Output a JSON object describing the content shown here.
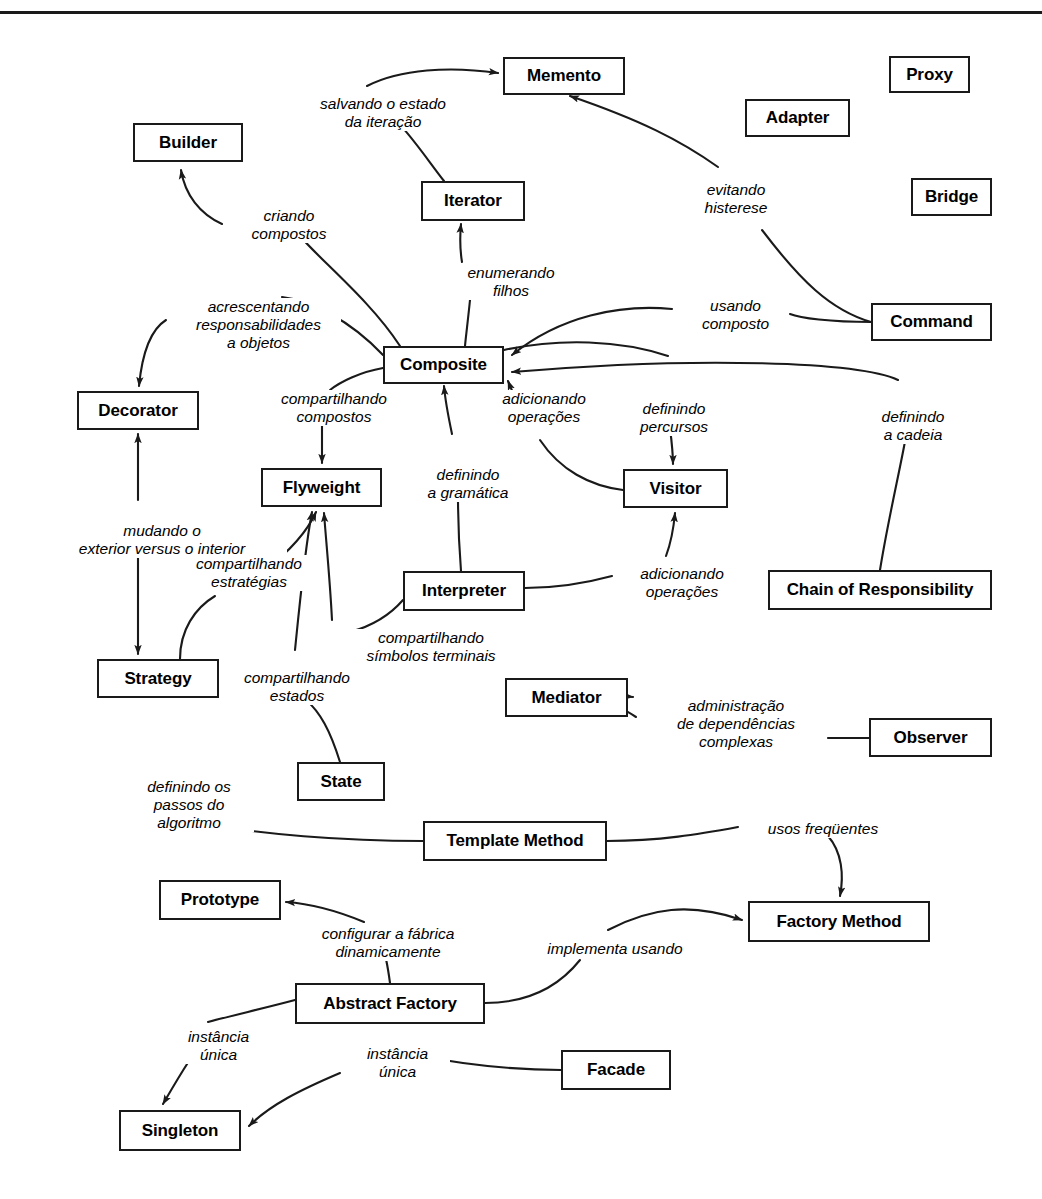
{
  "diagram": {
    "language": "pt-BR",
    "stroke_color": "#1a1a1a",
    "background_color": "#ffffff"
  },
  "nodes": [
    {
      "id": "memento",
      "label": "Memento",
      "x": 503,
      "y": 57,
      "w": 122,
      "h": 38
    },
    {
      "id": "proxy",
      "label": "Proxy",
      "x": 889,
      "y": 56,
      "w": 81,
      "h": 37
    },
    {
      "id": "adapter",
      "label": "Adapter",
      "x": 745,
      "y": 99,
      "w": 105,
      "h": 38
    },
    {
      "id": "builder",
      "label": "Builder",
      "x": 133,
      "y": 123,
      "w": 110,
      "h": 39
    },
    {
      "id": "bridge",
      "label": "Bridge",
      "x": 911,
      "y": 178,
      "w": 81,
      "h": 38
    },
    {
      "id": "iterator",
      "label": "Iterator",
      "x": 421,
      "y": 181,
      "w": 104,
      "h": 40
    },
    {
      "id": "command",
      "label": "Command",
      "x": 871,
      "y": 303,
      "w": 121,
      "h": 38
    },
    {
      "id": "composite",
      "label": "Composite",
      "x": 383,
      "y": 346,
      "w": 121,
      "h": 38
    },
    {
      "id": "decorator",
      "label": "Decorator",
      "x": 77,
      "y": 391,
      "w": 122,
      "h": 39
    },
    {
      "id": "flyweight",
      "label": "Flyweight",
      "x": 261,
      "y": 468,
      "w": 121,
      "h": 39
    },
    {
      "id": "visitor",
      "label": "Visitor",
      "x": 623,
      "y": 469,
      "w": 105,
      "h": 39
    },
    {
      "id": "interpreter",
      "label": "Interpreter",
      "x": 403,
      "y": 571,
      "w": 122,
      "h": 40
    },
    {
      "id": "chain",
      "label": "Chain of Responsibility",
      "x": 768,
      "y": 570,
      "w": 224,
      "h": 40
    },
    {
      "id": "strategy",
      "label": "Strategy",
      "x": 97,
      "y": 659,
      "w": 122,
      "h": 39
    },
    {
      "id": "mediator",
      "label": "Mediator",
      "x": 505,
      "y": 678,
      "w": 123,
      "h": 39
    },
    {
      "id": "observer",
      "label": "Observer",
      "x": 869,
      "y": 718,
      "w": 123,
      "h": 39
    },
    {
      "id": "state",
      "label": "State",
      "x": 297,
      "y": 762,
      "w": 88,
      "h": 39
    },
    {
      "id": "template",
      "label": "Template Method",
      "x": 423,
      "y": 821,
      "w": 184,
      "h": 40
    },
    {
      "id": "prototype",
      "label": "Prototype",
      "x": 159,
      "y": 880,
      "w": 122,
      "h": 40
    },
    {
      "id": "factory",
      "label": "Factory Method",
      "x": 748,
      "y": 901,
      "w": 182,
      "h": 41
    },
    {
      "id": "abstract",
      "label": "Abstract Factory",
      "x": 295,
      "y": 983,
      "w": 190,
      "h": 41
    },
    {
      "id": "facade",
      "label": "Facade",
      "x": 561,
      "y": 1050,
      "w": 110,
      "h": 40
    },
    {
      "id": "singleton",
      "label": "Singleton",
      "x": 119,
      "y": 1110,
      "w": 122,
      "h": 41
    }
  ],
  "edge_labels": [
    {
      "id": "l-salvando",
      "lines": [
        "salvando o estado",
        "da iteração"
      ],
      "x": 297,
      "y": 95,
      "w": 172,
      "align": "center"
    },
    {
      "id": "l-evitando",
      "lines": [
        "evitando",
        "histerese"
      ],
      "x": 686,
      "y": 181,
      "w": 100,
      "align": "center"
    },
    {
      "id": "l-criando",
      "lines": [
        "criando",
        "compostos"
      ],
      "x": 234,
      "y": 207,
      "w": 110,
      "align": "center"
    },
    {
      "id": "l-enumerando",
      "lines": [
        "enumerando",
        "filhos"
      ],
      "x": 452,
      "y": 264,
      "w": 118,
      "align": "center"
    },
    {
      "id": "l-acrescentando",
      "lines": [
        "acrescentando",
        "responsabilidades",
        "a objetos"
      ],
      "x": 176,
      "y": 298,
      "w": 165,
      "align": "center"
    },
    {
      "id": "l-usando",
      "lines": [
        "usando",
        "composto"
      ],
      "x": 683,
      "y": 297,
      "w": 105,
      "align": "center"
    },
    {
      "id": "l-compcompostos",
      "lines": [
        "compartilhando",
        "compostos"
      ],
      "x": 259,
      "y": 390,
      "w": 150,
      "align": "center"
    },
    {
      "id": "l-adicionando1",
      "lines": [
        "adicionando",
        "operações"
      ],
      "x": 483,
      "y": 390,
      "w": 122,
      "align": "center"
    },
    {
      "id": "l-definindoperc",
      "lines": [
        "definindo",
        "percursos"
      ],
      "x": 620,
      "y": 400,
      "w": 108,
      "align": "center"
    },
    {
      "id": "l-definindocad",
      "lines": [
        "definindo",
        "a cadeia"
      ],
      "x": 863,
      "y": 408,
      "w": 100,
      "align": "center"
    },
    {
      "id": "l-definindogram",
      "lines": [
        "definindo",
        "a gramática"
      ],
      "x": 408,
      "y": 466,
      "w": 120,
      "align": "center"
    },
    {
      "id": "l-mudando",
      "lines": [
        "mudando o",
        "exterior versus o interior"
      ],
      "x": 37,
      "y": 522,
      "w": 250,
      "align": "center"
    },
    {
      "id": "l-compestrat",
      "lines": [
        "compartilhando",
        "estratégias"
      ],
      "x": 174,
      "y": 555,
      "w": 150,
      "align": "center"
    },
    {
      "id": "l-adicionando2",
      "lines": [
        "adicionando",
        "operações"
      ],
      "x": 621,
      "y": 565,
      "w": 122,
      "align": "center"
    },
    {
      "id": "l-compsimb",
      "lines": [
        "compartilhando",
        "símbolos terminais"
      ],
      "x": 336,
      "y": 629,
      "w": 190,
      "align": "center"
    },
    {
      "id": "l-compestados",
      "lines": [
        "compartilhando",
        "estados"
      ],
      "x": 222,
      "y": 669,
      "w": 150,
      "align": "center"
    },
    {
      "id": "l-administracao",
      "lines": [
        "administração",
        "de dependências",
        "complexas"
      ],
      "x": 646,
      "y": 697,
      "w": 180,
      "align": "center"
    },
    {
      "id": "l-definindopassos",
      "lines": [
        "definindo os",
        "passos do",
        "algoritmo"
      ],
      "x": 124,
      "y": 778,
      "w": 130,
      "align": "center"
    },
    {
      "id": "l-usosfreq",
      "lines": [
        "usos freqüentes"
      ],
      "x": 748,
      "y": 820,
      "w": 150,
      "align": "center"
    },
    {
      "id": "l-configurar",
      "lines": [
        "configurar a fábrica",
        "dinamicamente"
      ],
      "x": 293,
      "y": 925,
      "w": 190,
      "align": "center"
    },
    {
      "id": "l-implementa",
      "lines": [
        "implementa usando"
      ],
      "x": 530,
      "y": 940,
      "w": 170,
      "align": "center"
    },
    {
      "id": "l-instancia1",
      "lines": [
        "instância",
        "única"
      ],
      "x": 166,
      "y": 1028,
      "w": 105,
      "align": "center"
    },
    {
      "id": "l-instancia2",
      "lines": [
        "instância",
        "única"
      ],
      "x": 345,
      "y": 1045,
      "w": 105,
      "align": "center"
    }
  ],
  "relationships": [
    {
      "from": "iterator",
      "to": "memento",
      "label": "salvando o estado da iteração"
    },
    {
      "from": "command",
      "to": "memento",
      "label": "evitando histerese"
    },
    {
      "from": "composite",
      "to": "builder",
      "label": "criando compostos"
    },
    {
      "from": "composite",
      "to": "iterator",
      "label": "enumerando filhos"
    },
    {
      "from": "composite",
      "to": "decorator",
      "label": "acrescentando responsabilidades a objetos"
    },
    {
      "from": "command",
      "to": "composite",
      "label": "usando composto"
    },
    {
      "from": "composite",
      "to": "flyweight",
      "label": "compartilhando compostos"
    },
    {
      "from": "visitor",
      "to": "composite",
      "label": "adicionando operações"
    },
    {
      "from": "composite",
      "to": "visitor",
      "label": "definindo percursos"
    },
    {
      "from": "chain",
      "to": "composite",
      "label": "definindo a cadeia"
    },
    {
      "from": "interpreter",
      "to": "composite",
      "label": "definindo a gramática"
    },
    {
      "from": "decorator",
      "to": "strategy",
      "label": "mudando o exterior versus o interior"
    },
    {
      "from": "strategy",
      "to": "flyweight",
      "label": "compartilhando estratégias"
    },
    {
      "from": "interpreter",
      "to": "visitor",
      "label": "adicionando operações"
    },
    {
      "from": "interpreter",
      "to": "flyweight",
      "label": "compartilhando símbolos terminais"
    },
    {
      "from": "state",
      "to": "flyweight",
      "label": "compartilhando estados"
    },
    {
      "from": "observer",
      "to": "mediator",
      "label": "administração de dependências complexas"
    },
    {
      "from": "template",
      "to": "strategy",
      "label": "definindo os passos do algoritmo"
    },
    {
      "from": "template",
      "to": "factory",
      "label": "usos freqüentes"
    },
    {
      "from": "abstract",
      "to": "prototype",
      "label": "configurar a fábrica dinamicamente"
    },
    {
      "from": "abstract",
      "to": "factory",
      "label": "implementa usando"
    },
    {
      "from": "abstract",
      "to": "singleton",
      "label": "instância única"
    },
    {
      "from": "facade",
      "to": "singleton",
      "label": "instância única"
    }
  ]
}
